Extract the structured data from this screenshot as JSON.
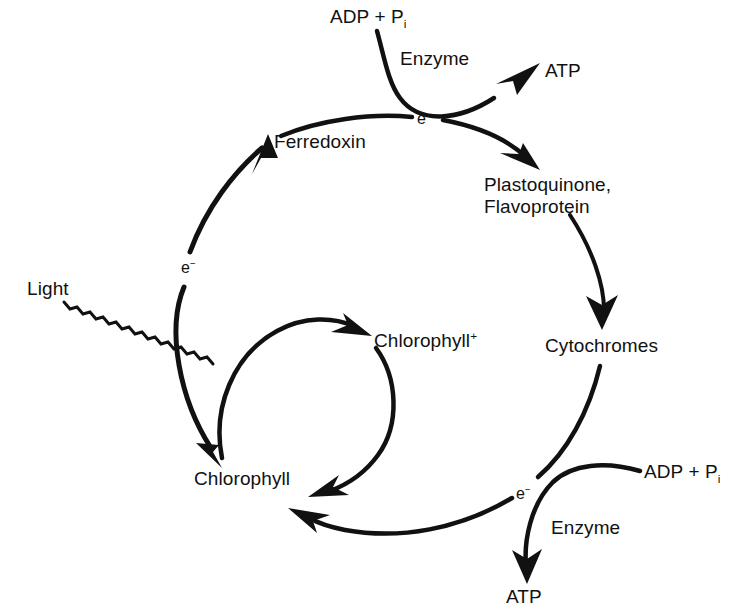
{
  "diagram": {
    "background_color": "#ffffff",
    "ink_color": "#111111",
    "nodes": [
      {
        "id": "adp-top",
        "label_html": "ADP + P",
        "sub": "i",
        "x": 330,
        "y": 8,
        "name": "label-adp-pi-top"
      },
      {
        "id": "enzyme-top",
        "label_html": "Enzyme",
        "sub": "",
        "x": 400,
        "y": 50,
        "name": "label-enzyme-top"
      },
      {
        "id": "atp-top",
        "label_html": "ATP",
        "sub": "",
        "x": 545,
        "y": 62,
        "name": "label-atp-top"
      },
      {
        "id": "e-top",
        "label_html": "e",
        "sup": "−",
        "x": 417,
        "y": 110,
        "name": "label-electron-top"
      },
      {
        "id": "ferredoxin",
        "label_html": "Ferredoxin",
        "sub": "",
        "x": 274,
        "y": 132,
        "name": "label-ferredoxin"
      },
      {
        "id": "plastoquinone",
        "label_html": "Plastoquinone,\nFlavoprotein",
        "sub": "",
        "x": 484,
        "y": 175,
        "name": "label-plastoquinone-flavoprotein"
      },
      {
        "id": "e-left",
        "label_html": "e",
        "sup": "−",
        "x": 181,
        "y": 259,
        "name": "label-electron-left"
      },
      {
        "id": "light",
        "label_html": "Light",
        "sub": "",
        "x": 27,
        "y": 279,
        "name": "label-light"
      },
      {
        "id": "chlorophyll-plus",
        "label_html": "Chlorophyll",
        "sup": "+",
        "x": 374,
        "y": 331,
        "name": "label-chlorophyll-plus"
      },
      {
        "id": "cytochromes",
        "label_html": "Cytochromes",
        "sub": "",
        "x": 545,
        "y": 336,
        "name": "label-cytochromes"
      },
      {
        "id": "adp-bottom",
        "label_html": "ADP + P",
        "sub": "i",
        "x": 644,
        "y": 462,
        "name": "label-adp-pi-bottom"
      },
      {
        "id": "chlorophyll",
        "label_html": "Chlorophyll",
        "sub": "",
        "x": 194,
        "y": 469,
        "name": "label-chlorophyll"
      },
      {
        "id": "e-bottom",
        "label_html": "e",
        "sup": "−",
        "x": 516,
        "y": 485,
        "name": "label-electron-bottom"
      },
      {
        "id": "enzyme-bottom",
        "label_html": "Enzyme",
        "sub": "",
        "x": 551,
        "y": 518,
        "name": "label-enzyme-bottom"
      },
      {
        "id": "atp-bottom",
        "label_html": "ATP",
        "sub": "",
        "x": 506,
        "y": 587,
        "name": "label-atp-bottom"
      }
    ],
    "edges": [
      {
        "id": "light-ray",
        "from": "Light",
        "to": "Chlorophyll",
        "style": "zigzag-arrow",
        "name": "arrow-light-to-chlorophyll"
      },
      {
        "id": "chl-to-ferredoxin",
        "from": "Chlorophyll",
        "to": "Ferredoxin",
        "style": "curved-arrow",
        "marker": "e-",
        "name": "arrow-chlorophyll-to-ferredoxin"
      },
      {
        "id": "fd-to-pq",
        "from": "Ferredoxin",
        "to": "Plastoquinone, Flavoprotein",
        "style": "curved-arrow",
        "marker": "e-",
        "name": "arrow-ferredoxin-to-plastoquinone"
      },
      {
        "id": "adp-to-atp-top",
        "from": "ADP + Pi",
        "to": "ATP",
        "style": "curved-arrow",
        "marker": "Enzyme",
        "name": "arrow-adp-to-atp-top"
      },
      {
        "id": "pq-to-cyt",
        "from": "Plastoquinone, Flavoprotein",
        "to": "Cytochromes",
        "style": "curved-arrow",
        "name": "arrow-plastoquinone-to-cytochromes"
      },
      {
        "id": "cyt-to-chl",
        "from": "Cytochromes",
        "to": "Chlorophyll",
        "style": "curved-arrow",
        "marker": "e-",
        "name": "arrow-cytochromes-to-chlorophyll"
      },
      {
        "id": "adp-to-atp-bottom",
        "from": "ADP + Pi",
        "to": "ATP",
        "style": "curved-arrow",
        "marker": "Enzyme",
        "name": "arrow-adp-to-atp-bottom"
      },
      {
        "id": "chl-to-chlplus",
        "from": "Chlorophyll",
        "to": "Chlorophyll+",
        "style": "curved-arrow",
        "name": "arrow-chlorophyll-to-chlorophyll-plus"
      },
      {
        "id": "chlplus-to-chl",
        "from": "Chlorophyll+",
        "to": "Chlorophyll",
        "style": "curved-arrow",
        "name": "arrow-chlorophyll-plus-to-chlorophyll"
      }
    ]
  }
}
